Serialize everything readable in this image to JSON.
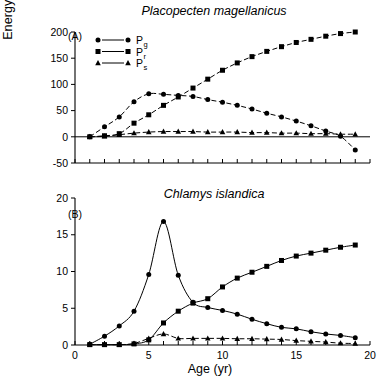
{
  "figure": {
    "y_axis_title_main": "Energy (kJ yr",
    "y_axis_title_exp": "−1",
    "y_axis_title_close": ")",
    "x_axis_title": "Age (yr)"
  },
  "legend": {
    "entries": [
      {
        "base": "P",
        "sub": "g",
        "marker": "circle",
        "name": "production-growth"
      },
      {
        "base": "P",
        "sub": "r",
        "marker": "square",
        "name": "production-reproduction"
      },
      {
        "base": "P",
        "sub": "s",
        "marker": "triangle",
        "name": "production-shell"
      }
    ]
  },
  "chart_data": [
    {
      "type": "line",
      "panel": "A",
      "panel_tag": "(A)",
      "title": "Placopecten magellanicus",
      "xlabel": "Age (yr)",
      "ylabel": "Energy (kJ yr−1)",
      "xlim": [
        0,
        20
      ],
      "ylim": [
        -50,
        200
      ],
      "xticks": [
        0,
        1,
        2,
        3,
        4,
        5,
        6,
        7,
        8,
        9,
        10,
        11,
        12,
        13,
        14,
        15,
        16,
        17,
        18,
        19,
        20
      ],
      "xticklabels": [
        "",
        "",
        "",
        "",
        "",
        "",
        "",
        "",
        "",
        "",
        "",
        "",
        "",
        "",
        "",
        "",
        "",
        "",
        "",
        "",
        ""
      ],
      "yticks": [
        -50,
        0,
        50,
        100,
        150,
        200
      ],
      "yticklabels": [
        "-50",
        "0",
        "50",
        "100",
        "150",
        "200"
      ],
      "grid": false,
      "legend_position": "upper-left",
      "x": [
        1,
        2,
        3,
        4,
        5,
        6,
        7,
        8,
        9,
        10,
        11,
        12,
        13,
        14,
        15,
        16,
        17,
        18,
        19
      ],
      "series": [
        {
          "name": "Pg",
          "marker": "circle",
          "linestyle": "dashed",
          "values": [
            0,
            19,
            38,
            67,
            82,
            81,
            79,
            77,
            71,
            66,
            60,
            53,
            45,
            38,
            30,
            21,
            11,
            1,
            -25
          ]
        },
        {
          "name": "Pr",
          "marker": "square",
          "linestyle": "dashed",
          "values": [
            0,
            2,
            6,
            26,
            42,
            60,
            76,
            93,
            110,
            127,
            141,
            153,
            163,
            172,
            180,
            186,
            192,
            197,
            200
          ]
        },
        {
          "name": "Ps",
          "marker": "triangle",
          "linestyle": "dashed",
          "values": [
            0,
            1,
            4,
            7,
            9,
            10,
            10,
            10,
            9,
            9,
            9,
            8,
            8,
            7,
            7,
            6,
            6,
            5,
            5
          ]
        }
      ]
    },
    {
      "type": "line",
      "panel": "B",
      "panel_tag": "(B)",
      "title": "Chlamys islandica",
      "xlabel": "Age (yr)",
      "ylabel": "Energy (kJ yr−1)",
      "xlim": [
        0,
        20
      ],
      "ylim": [
        0,
        20
      ],
      "xticks": [
        0,
        1,
        2,
        3,
        4,
        5,
        6,
        7,
        8,
        9,
        10,
        11,
        12,
        13,
        14,
        15,
        16,
        17,
        18,
        19,
        20
      ],
      "xticklabels": [
        "0",
        "",
        "",
        "",
        "",
        "5",
        "",
        "",
        "",
        "",
        "10",
        "",
        "",
        "",
        "",
        "15",
        "",
        "",
        "",
        "",
        "20"
      ],
      "yticks": [
        0,
        5,
        10,
        15,
        20
      ],
      "yticklabels": [
        "0",
        "5",
        "10",
        "15",
        "20"
      ],
      "grid": false,
      "legend_position": "none",
      "x": [
        1,
        2,
        3,
        4,
        5,
        6,
        7,
        8,
        9,
        10,
        11,
        12,
        13,
        14,
        15,
        16,
        17,
        18,
        19
      ],
      "series": [
        {
          "name": "Pg",
          "marker": "circle",
          "linestyle": "solid",
          "values": [
            0.1,
            1.2,
            2.6,
            4.6,
            9.6,
            16.8,
            9.5,
            5.8,
            5.1,
            4.7,
            4.2,
            3.5,
            2.9,
            2.4,
            2.2,
            1.8,
            1.5,
            1.3,
            1.0
          ]
        },
        {
          "name": "Pr",
          "marker": "square",
          "linestyle": "solid",
          "values": [
            0.05,
            0.05,
            0.05,
            0.15,
            0.7,
            3.0,
            4.6,
            5.7,
            6.3,
            7.9,
            9.1,
            9.9,
            10.7,
            11.5,
            12.1,
            12.5,
            12.9,
            13.3,
            13.6
          ]
        },
        {
          "name": "Ps",
          "marker": "triangle",
          "linestyle": "dashed",
          "values": [
            0.05,
            0.05,
            0.05,
            0.2,
            0.9,
            1.5,
            0.9,
            0.9,
            0.9,
            0.9,
            0.85,
            0.85,
            0.8,
            0.75,
            0.6,
            0.5,
            0.4,
            0.25,
            0.2
          ]
        }
      ]
    }
  ]
}
